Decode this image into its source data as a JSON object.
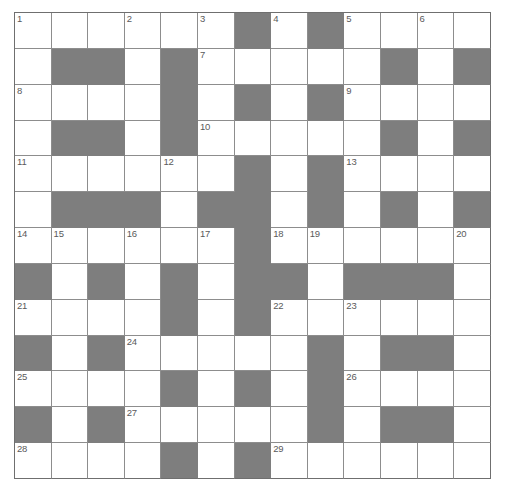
{
  "puzzle": {
    "kind": "crossword-grid",
    "title": "Crossword puzzle grid",
    "columns": 13,
    "rows": 13,
    "cell_size_px": 36,
    "colors": {
      "block_fill": "#7e7e7e",
      "open_fill": "#ffffff",
      "grid_line": "#8d8d8d",
      "border": "#6f6f6f",
      "number_text": "#5a5a5a"
    },
    "legend": {
      "open_cell": "white answer square",
      "block_cell": "grey blocked square"
    },
    "clue_count": 29,
    "clue_numbers": [
      1,
      2,
      3,
      4,
      5,
      6,
      7,
      8,
      9,
      10,
      11,
      12,
      13,
      14,
      15,
      16,
      17,
      18,
      19,
      20,
      21,
      22,
      23,
      24,
      25,
      26,
      27,
      28,
      29
    ],
    "grid": [
      [
        "O",
        "O",
        "O",
        "O",
        "O",
        "O",
        "B",
        "O",
        "B",
        "O",
        "O",
        "O",
        "O"
      ],
      [
        "O",
        "B",
        "B",
        "O",
        "B",
        "O",
        "O",
        "O",
        "O",
        "O",
        "B",
        "O",
        "B"
      ],
      [
        "O",
        "O",
        "O",
        "O",
        "B",
        "O",
        "B",
        "O",
        "B",
        "O",
        "O",
        "O",
        "O"
      ],
      [
        "O",
        "B",
        "B",
        "O",
        "B",
        "O",
        "O",
        "O",
        "O",
        "O",
        "B",
        "O",
        "B"
      ],
      [
        "O",
        "O",
        "O",
        "O",
        "O",
        "O",
        "B",
        "O",
        "B",
        "O",
        "O",
        "O",
        "O"
      ],
      [
        "O",
        "B",
        "B",
        "B",
        "O",
        "B",
        "B",
        "O",
        "B",
        "O",
        "B",
        "O",
        "B"
      ],
      [
        "O",
        "O",
        "O",
        "O",
        "O",
        "O",
        "B",
        "O",
        "O",
        "O",
        "O",
        "O",
        "O"
      ],
      [
        "B",
        "O",
        "B",
        "O",
        "B",
        "O",
        "B",
        "B",
        "O",
        "B",
        "B",
        "B",
        "O"
      ],
      [
        "O",
        "O",
        "O",
        "O",
        "B",
        "O",
        "B",
        "O",
        "O",
        "O",
        "O",
        "O",
        "O"
      ],
      [
        "B",
        "O",
        "B",
        "O",
        "O",
        "O",
        "O",
        "O",
        "B",
        "O",
        "B",
        "B",
        "O"
      ],
      [
        "O",
        "O",
        "O",
        "O",
        "B",
        "O",
        "B",
        "O",
        "B",
        "O",
        "O",
        "O",
        "O"
      ],
      [
        "B",
        "O",
        "B",
        "O",
        "O",
        "O",
        "O",
        "O",
        "B",
        "O",
        "B",
        "B",
        "O"
      ],
      [
        "O",
        "O",
        "O",
        "O",
        "B",
        "O",
        "B",
        "O",
        "O",
        "O",
        "O",
        "O",
        "O"
      ]
    ],
    "numbers": [
      [
        "1",
        "",
        "",
        "2",
        "",
        "3",
        "",
        "4",
        "",
        "5",
        "",
        "6",
        ""
      ],
      [
        "",
        "",
        "",
        "",
        "",
        "7",
        "",
        "",
        "",
        "",
        "",
        "",
        ""
      ],
      [
        "8",
        "",
        "",
        "",
        "",
        "",
        "",
        "",
        "",
        "9",
        "",
        "",
        ""
      ],
      [
        "",
        "",
        "",
        "",
        "",
        "10",
        "",
        "",
        "",
        "",
        "",
        "",
        ""
      ],
      [
        "11",
        "",
        "",
        "",
        "12",
        "",
        "",
        "",
        "",
        "13",
        "",
        "",
        ""
      ],
      [
        "",
        "",
        "",
        "",
        "",
        "",
        "",
        "",
        "",
        "",
        "",
        "",
        ""
      ],
      [
        "14",
        "15",
        "",
        "16",
        "",
        "17",
        "",
        "18",
        "19",
        "",
        "",
        "",
        "20"
      ],
      [
        "",
        "",
        "",
        "",
        "",
        "",
        "",
        "",
        "",
        "",
        "",
        "",
        ""
      ],
      [
        "21",
        "",
        "",
        "",
        "",
        "",
        "",
        "22",
        "",
        "23",
        "",
        "",
        ""
      ],
      [
        "",
        "",
        "",
        "24",
        "",
        "",
        "",
        "",
        "",
        "",
        "",
        "",
        ""
      ],
      [
        "25",
        "",
        "",
        "",
        "",
        "",
        "",
        "",
        "",
        "26",
        "",
        "",
        ""
      ],
      [
        "",
        "",
        "",
        "27",
        "",
        "",
        "",
        "",
        "",
        "",
        "",
        "",
        ""
      ],
      [
        "28",
        "",
        "",
        "",
        "",
        "",
        "",
        "29",
        "",
        "",
        "",
        "",
        ""
      ]
    ],
    "letters": [
      [
        "",
        "",
        "",
        "",
        "",
        "",
        "",
        "",
        "",
        "",
        "",
        "",
        ""
      ],
      [
        "",
        "",
        "",
        "",
        "",
        "",
        "",
        "",
        "",
        "",
        "",
        "",
        ""
      ],
      [
        "",
        "",
        "",
        "",
        "",
        "",
        "",
        "",
        "",
        "",
        "",
        "",
        ""
      ],
      [
        "",
        "",
        "",
        "",
        "",
        "",
        "",
        "",
        "",
        "",
        "",
        "",
        ""
      ],
      [
        "",
        "",
        "",
        "",
        "",
        "",
        "",
        "",
        "",
        "",
        "",
        "",
        ""
      ],
      [
        "",
        "",
        "",
        "",
        "",
        "",
        "",
        "",
        "",
        "",
        "",
        "",
        ""
      ],
      [
        "",
        "",
        "",
        "",
        "",
        "",
        "",
        "",
        "",
        "",
        "",
        "",
        ""
      ],
      [
        "",
        "",
        "",
        "",
        "",
        "",
        "",
        "",
        "",
        "",
        "",
        "",
        ""
      ],
      [
        "",
        "",
        "",
        "",
        "",
        "",
        "",
        "",
        "",
        "",
        "",
        "",
        ""
      ],
      [
        "",
        "",
        "",
        "",
        "",
        "",
        "",
        "",
        "",
        "",
        "",
        "",
        ""
      ],
      [
        "",
        "",
        "",
        "",
        "",
        "",
        "",
        "",
        "",
        "",
        "",
        "",
        ""
      ],
      [
        "",
        "",
        "",
        "",
        "",
        "",
        "",
        "",
        "",
        "",
        "",
        "",
        ""
      ],
      [
        "",
        "",
        "",
        "",
        "",
        "",
        "",
        "",
        "",
        "",
        "",
        "",
        ""
      ]
    ]
  }
}
